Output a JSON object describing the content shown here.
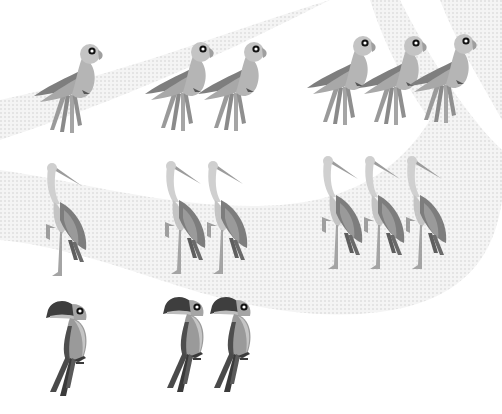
{
  "worksheet": {
    "theme": "bird counting",
    "rows": [
      {
        "bird": "parrot",
        "groups": [
          {
            "count": 1,
            "positions": [
              [
                32,
                38
              ]
            ]
          },
          {
            "count": 2,
            "positions": [
              [
                143,
                36
              ],
              [
                196,
                36
              ]
            ]
          },
          {
            "count": 3,
            "positions": [
              [
                305,
                30
              ],
              [
                356,
                30
              ],
              [
                406,
                28
              ]
            ]
          }
        ]
      },
      {
        "bird": "heron",
        "groups": [
          {
            "count": 1,
            "positions": [
              [
                42,
                160
              ]
            ]
          },
          {
            "count": 2,
            "positions": [
              [
                161,
                158
              ],
              [
                203,
                158
              ]
            ]
          },
          {
            "count": 3,
            "positions": [
              [
                318,
                153
              ],
              [
                360,
                153
              ],
              [
                402,
                153
              ]
            ]
          }
        ]
      },
      {
        "bird": "toucan",
        "groups": [
          {
            "count": 1,
            "positions": [
              [
                44,
                300
              ]
            ]
          },
          {
            "count": 2,
            "positions": [
              [
                161,
                296
              ],
              [
                208,
                296
              ]
            ]
          },
          {
            "count": 0,
            "positions": []
          }
        ]
      }
    ]
  },
  "colors": {
    "background": "#ffffff",
    "band": "#ececec",
    "bird_light": "#b9b9b9",
    "bird_mid": "#8f8f8f",
    "bird_dark": "#5e5e5e",
    "bird_darkest": "#3c3c3c",
    "eye_white": "#ffffff",
    "eye_black": "#111111"
  }
}
